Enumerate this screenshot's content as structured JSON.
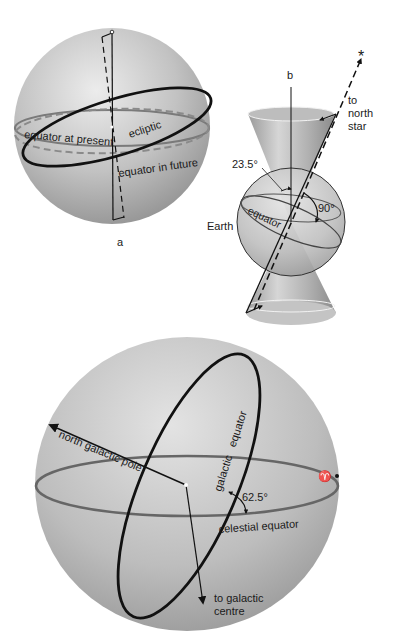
{
  "figure_a": {
    "caption": "a",
    "labels": {
      "equator_present": "equator at present",
      "ecliptic": "ecliptic",
      "equator_future": "equator in future"
    }
  },
  "figure_b": {
    "caption": "b",
    "labels": {
      "angle_tilt": "23.5°",
      "angle_right": "90°",
      "earth": "Earth",
      "equator": "equator",
      "north_star_line1": "to",
      "north_star_line2": "north",
      "north_star_line3": "star",
      "star_glyph": "*"
    }
  },
  "figure_c": {
    "labels": {
      "north_galactic_pole": "north galactic pole",
      "galactic_equator": "galactic   equator",
      "angle": "62.5°",
      "celestial_equator": "celestial equator",
      "vernal_equinox_symbol": "♈",
      "galactic_centre_line1": "to galactic",
      "galactic_centre_line2": "centre"
    }
  },
  "colors": {
    "sphere_light": "#e6e6e6",
    "sphere_mid": "#b5b5b5",
    "sphere_dark": "#8e8e8e",
    "ink": "#111111",
    "grey_ring": "#6f6f6f"
  }
}
